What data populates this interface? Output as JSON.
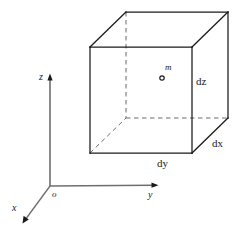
{
  "figure": {
    "type": "geometry-diagram",
    "background_color": "#ffffff",
    "line_color": "#1a1a1a",
    "dash_color": "#555555"
  },
  "axes": {
    "origin_label": "o",
    "x_label": "x",
    "y_label": "y",
    "z_label": "z",
    "origin_point": [
      50,
      186
    ],
    "x_tip": [
      22,
      222
    ],
    "y_tip": [
      158,
      185
    ],
    "z_tip": [
      50,
      75
    ]
  },
  "cube": {
    "front": {
      "top_left": [
        90,
        47
      ],
      "top_right": [
        192,
        47
      ],
      "bottom_right": [
        192,
        153
      ],
      "bottom_left": [
        90,
        153
      ]
    },
    "back": {
      "top_left": [
        126,
        12
      ],
      "top_right": [
        228,
        12
      ],
      "bottom_right": [
        228,
        118
      ],
      "bottom_left": [
        126,
        118
      ]
    }
  },
  "labels": {
    "mass": "m",
    "dx": "dx",
    "dy": "dy",
    "dz": "dz"
  },
  "marker": {
    "name": "mass-point-marker",
    "center": [
      162,
      78
    ],
    "radius": 2.2
  }
}
